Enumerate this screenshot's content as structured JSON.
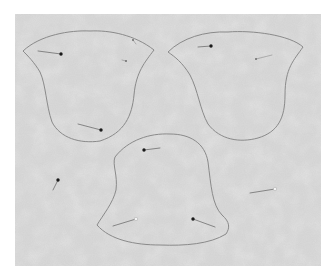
{
  "scene": {
    "description": "Grey felt fabric with three bell-shaped pattern outlines traced and pinned",
    "background_color": "#ffffff",
    "fabric": {
      "color": "#d9d9d9",
      "mottle_dark": "#c8c8c8",
      "mottle_light": "#e6e6e6",
      "bounds": {
        "x": 15,
        "y": 14,
        "width": 306,
        "height": 252
      }
    },
    "outline_color": "#8a8a8a",
    "pin_head_color": "#1a1a1a",
    "pin_shaft_color": "#7a7a7a",
    "shapes": [
      {
        "name": "bell-top-left",
        "path": "M23,51 C40,35 70,30 90,31 C110,30 135,35 154,50 C145,62 136,72 134,95 C132,115 125,133 100,141 C80,144 60,138 52,122 C46,105 46,85 40,72 C34,62 28,56 23,51 Z",
        "pins": [
          {
            "head": [
              61,
              54
            ],
            "tail": [
              38,
              51
            ]
          },
          {
            "head": [
              101,
              130
            ],
            "tail": [
              78,
              124
            ]
          },
          {
            "tail": [
              136,
              44
            ],
            "head": [
              133,
              40
            ],
            "faint": true
          },
          {
            "head": [
              126,
              61
            ],
            "tail": [
              122,
              60
            ],
            "faint": true
          }
        ]
      },
      {
        "name": "bell-top-right",
        "path": "M168,52 C182,38 205,31 228,32 C252,30 290,35 303,47 C294,60 285,68 285,95 C285,118 278,132 258,138 C240,143 220,140 208,124 C200,110 198,90 190,75 C182,62 175,57 168,52 Z",
        "pins": [
          {
            "head": [
              211,
              46
            ],
            "tail": [
              198,
              47
            ]
          },
          {
            "head": [
              256,
              59
            ],
            "tail": [
              272,
              55
            ],
            "faint": true
          }
        ]
      },
      {
        "name": "bell-bottom",
        "path": "M115,157 C128,140 150,133 170,134 C190,134 205,143 208,162 C211,185 212,205 222,215 C230,222 230,228 226,234 C210,244 185,246 160,245 C135,245 110,240 97,225 C103,215 113,203 116,190 C118,175 112,165 115,157 Z",
        "pins": [
          {
            "head": [
              144,
              150
            ],
            "tail": [
              160,
              148
            ]
          },
          {
            "head": [
              136,
              219
            ],
            "tail": [
              113,
              226
            ],
            "white": true
          },
          {
            "head": [
              193,
              219
            ],
            "tail": [
              215,
              227
            ]
          }
        ]
      }
    ],
    "loose_pins": [
      {
        "head": [
          58,
          180
        ],
        "tail": [
          53,
          190
        ]
      },
      {
        "head": [
          275,
          189
        ],
        "tail": [
          250,
          193
        ],
        "white": true
      }
    ]
  }
}
